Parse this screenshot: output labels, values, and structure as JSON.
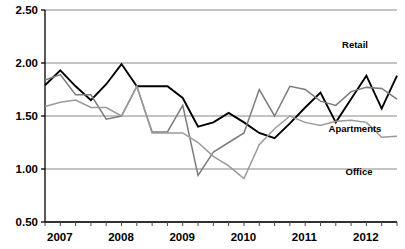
{
  "chart_data": {
    "type": "line",
    "title": "",
    "xlabel": "",
    "ylabel": "",
    "ylim": [
      0.5,
      2.5
    ],
    "yticks": [
      0.5,
      1.0,
      1.5,
      2.0,
      2.5
    ],
    "ytick_labels": [
      "0.50",
      "1.00",
      "1.50",
      "2.00",
      "2.50"
    ],
    "grid": true,
    "legend_position": "inline-right-labels",
    "x": [
      "2007Q1",
      "2007Q2",
      "2007Q3",
      "2007Q4",
      "2008Q1",
      "2008Q2",
      "2008Q3",
      "2008Q4",
      "2009Q1",
      "2009Q2",
      "2009Q3",
      "2009Q4",
      "2010Q1",
      "2010Q2",
      "2010Q3",
      "2010Q4",
      "2011Q1",
      "2011Q2",
      "2011Q3",
      "2011Q4",
      "2012Q1",
      "2012Q2",
      "2012Q3",
      "2012Q4"
    ],
    "xtick_labels": [
      "2007",
      "2008",
      "2009",
      "2010",
      "2011",
      "2012"
    ],
    "xtick_label_positions": [
      0,
      4,
      8,
      12,
      16,
      20
    ],
    "series": [
      {
        "name": "Retail",
        "color": "#000000",
        "width": 1.9,
        "values": [
          1.79,
          1.93,
          1.78,
          1.65,
          1.8,
          1.99,
          1.78,
          1.78,
          1.78,
          1.67,
          1.4,
          1.44,
          1.53,
          1.44,
          1.34,
          1.29,
          1.43,
          1.58,
          1.72,
          1.44,
          1.66,
          1.88,
          1.57,
          1.88
        ]
      },
      {
        "name": "Apartments",
        "color": "#7c7c7c",
        "width": 1.5,
        "values": [
          1.84,
          1.89,
          1.7,
          1.7,
          1.47,
          1.5,
          1.78,
          1.35,
          1.35,
          1.6,
          0.94,
          1.16,
          1.25,
          1.34,
          1.75,
          1.5,
          1.78,
          1.75,
          1.64,
          1.6,
          1.73,
          1.77,
          1.76,
          1.66
        ]
      },
      {
        "name": "Office",
        "color": "#9a9a9a",
        "width": 1.5,
        "values": [
          1.59,
          1.63,
          1.65,
          1.58,
          1.58,
          1.5,
          1.78,
          1.34,
          1.34,
          1.34,
          1.25,
          1.12,
          1.03,
          0.91,
          1.23,
          1.38,
          1.5,
          1.44,
          1.41,
          1.45,
          1.46,
          1.44,
          1.3,
          1.31
        ]
      }
    ],
    "series_label_annotations": [
      {
        "text": "Retail",
        "x": 355,
        "y": 48
      },
      {
        "text": "Apartments",
        "x": 355,
        "y": 132
      },
      {
        "text": "Office",
        "x": 359,
        "y": 175
      }
    ]
  }
}
